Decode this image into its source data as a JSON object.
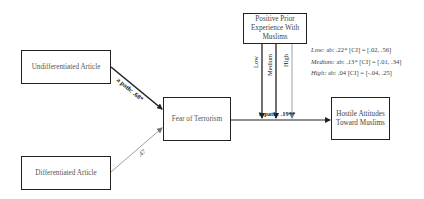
{
  "nodes": {
    "undifferentiated": {
      "label": "Undifferentiated Article"
    },
    "differentiated": {
      "label": "Differentiated Article"
    },
    "fear": {
      "label": "Fear of Terrorism"
    },
    "moderator": {
      "label": "Positive Prior Experience With Muslims"
    },
    "hostile": {
      "label": "Hostile Attitudes Toward Muslims"
    }
  },
  "paths": {
    "a_path": "a path: .68*",
    "differentiated_path": ".47",
    "b_path": "b path: .19**"
  },
  "moderator_levels": [
    "Low",
    "Medium",
    "High"
  ],
  "conditional_effects": [
    {
      "level": "Low:",
      "text": " ab: .22* [CI] = [.02, .56]"
    },
    {
      "level": "Medium:",
      "text": " ab: .13* [CI] = [.01, .34]"
    },
    {
      "level": "High:",
      "text": " ab: .04 [CI] = [-.04, .25]"
    }
  ]
}
